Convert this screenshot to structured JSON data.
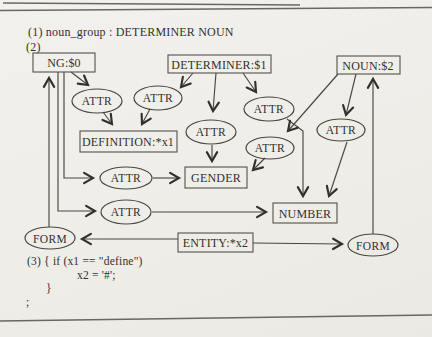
{
  "figure": {
    "header": {
      "title_rule": "(1) noun_group :  DETERMINER NOUN",
      "section2_label": "(2)"
    },
    "nodes": {
      "ng": "NG:$0",
      "determiner": "DETERMINER:$1",
      "noun": "NOUN:$2",
      "definition": "DEFINITION:*x1",
      "gender": "GENDER",
      "number": "NUMBER",
      "entity": "ENTITY:*x2"
    },
    "edge_label": "ATTR",
    "form_label": "FORM",
    "code": {
      "line1": "(3)  { if (x1 == \"define\")",
      "line2": "x2 = '#';",
      "line3": "}",
      "line4": ";"
    },
    "colors": {
      "paper": "#f1efeb",
      "ink": "#33302b",
      "line": "#4a453f"
    }
  }
}
